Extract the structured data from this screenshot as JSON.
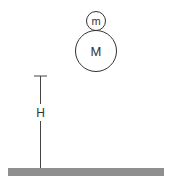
{
  "diagram": {
    "small_mass_label": "m",
    "large_mass_label": "M",
    "height_label": "H",
    "colors": {
      "stroke": "#333333",
      "ground": "#8f8f8f",
      "background": "#ffffff"
    }
  }
}
